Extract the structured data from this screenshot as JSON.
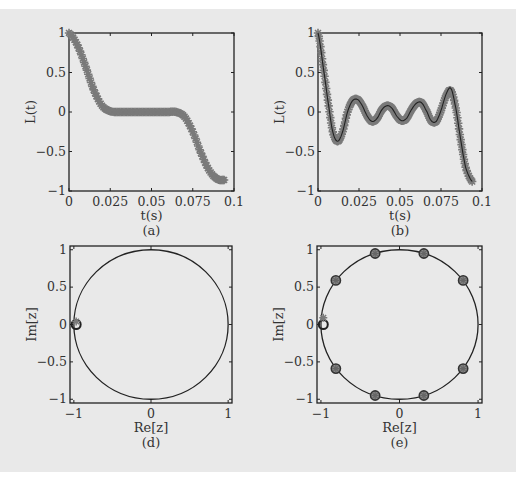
{
  "chart_data": [
    {
      "id": "a",
      "type": "line",
      "panel_label": "(a)",
      "xlabel": "t(s)",
      "ylabel": "L(t)",
      "xlim": [
        0,
        0.1
      ],
      "ylim": [
        -1,
        1
      ],
      "xticks": [
        0,
        0.025,
        0.05,
        0.075,
        0.1
      ],
      "xtick_labels": [
        "0",
        "0.025",
        "0.05",
        "0.075",
        "0.1"
      ],
      "yticks": [
        -1,
        -0.5,
        0,
        0.5,
        1
      ],
      "ytick_labels": [
        "−1",
        "−0.5",
        "0",
        "0.5",
        "1"
      ],
      "series": [
        {
          "name": "L(t) samples",
          "marker": "star",
          "color": "#7a7a7a",
          "x": [
            0,
            0.005,
            0.01,
            0.015,
            0.02,
            0.025,
            0.03,
            0.035,
            0.04,
            0.045,
            0.05,
            0.055,
            0.06,
            0.065,
            0.07,
            0.075,
            0.08,
            0.085,
            0.09,
            0.094
          ],
          "y": [
            1.0,
            0.85,
            0.58,
            0.28,
            0.08,
            0.01,
            0.0,
            0.0,
            0.0,
            0.0,
            0.0,
            0.0,
            0.0,
            0.0,
            -0.06,
            -0.25,
            -0.52,
            -0.74,
            -0.85,
            -0.86
          ]
        }
      ]
    },
    {
      "id": "b",
      "type": "line",
      "panel_label": "(b)",
      "xlabel": "t(s)",
      "ylabel": "L(t)",
      "xlim": [
        0,
        0.1
      ],
      "ylim": [
        -1,
        1
      ],
      "xticks": [
        0,
        0.025,
        0.05,
        0.075,
        0.1
      ],
      "xtick_labels": [
        "0",
        "0.025",
        "0.05",
        "0.075",
        "0.1"
      ],
      "yticks": [
        -1,
        -0.5,
        0,
        0.5,
        1
      ],
      "ytick_labels": [
        "−1",
        "−0.5",
        "0",
        "0.5",
        "1"
      ],
      "series": [
        {
          "name": "L(t) samples",
          "marker": "star",
          "color": "#7a7a7a",
          "x": [
            0,
            0.003,
            0.006,
            0.009,
            0.012,
            0.015,
            0.018,
            0.021,
            0.024,
            0.027,
            0.03,
            0.033,
            0.036,
            0.039,
            0.042,
            0.045,
            0.048,
            0.051,
            0.054,
            0.057,
            0.06,
            0.063,
            0.066,
            0.069,
            0.072,
            0.075,
            0.078,
            0.081,
            0.084,
            0.087,
            0.09,
            0.094
          ],
          "y": [
            1.0,
            0.6,
            0.15,
            -0.25,
            -0.37,
            -0.25,
            0.0,
            0.14,
            0.16,
            0.08,
            -0.05,
            -0.12,
            -0.08,
            0.03,
            0.08,
            0.05,
            -0.05,
            -0.11,
            -0.08,
            0.03,
            0.11,
            0.12,
            0.02,
            -0.11,
            -0.12,
            0.02,
            0.2,
            0.27,
            0.05,
            -0.35,
            -0.7,
            -0.88
          ]
        },
        {
          "name": "L(t) reference",
          "marker": "none",
          "color": "#222222",
          "x": [
            0,
            0.003,
            0.006,
            0.009,
            0.012,
            0.015,
            0.018,
            0.021,
            0.024,
            0.027,
            0.03,
            0.033,
            0.036,
            0.039,
            0.042,
            0.045,
            0.048,
            0.051,
            0.054,
            0.057,
            0.06,
            0.063,
            0.066,
            0.069,
            0.072,
            0.075,
            0.078,
            0.081,
            0.084,
            0.087,
            0.09,
            0.094
          ],
          "y": [
            1.0,
            0.6,
            0.15,
            -0.25,
            -0.37,
            -0.25,
            0.0,
            0.14,
            0.16,
            0.08,
            -0.05,
            -0.12,
            -0.08,
            0.03,
            0.08,
            0.05,
            -0.05,
            -0.11,
            -0.08,
            0.03,
            0.11,
            0.12,
            0.02,
            -0.11,
            -0.12,
            0.02,
            0.22,
            0.3,
            0.05,
            -0.35,
            -0.7,
            -0.88
          ]
        }
      ]
    },
    {
      "id": "d",
      "type": "scatter",
      "panel_label": "(d)",
      "xlabel": "Re[z]",
      "ylabel": "Im[z]",
      "xlim": [
        -1.05,
        1.05
      ],
      "ylim": [
        -1.05,
        1.05
      ],
      "xticks": [
        -1,
        0,
        1
      ],
      "xtick_labels": [
        "−1",
        "0",
        "1"
      ],
      "yticks": [
        -1,
        -0.5,
        0,
        0.5,
        1
      ],
      "ytick_labels": [
        "−1",
        "−0.5",
        "0",
        "0.5",
        "1"
      ],
      "unit_circle": true,
      "circle_color": "#222222",
      "points": [
        {
          "re": -0.97,
          "im": 0.0,
          "marker": "circle",
          "color": "#222222"
        },
        {
          "re": -0.97,
          "im": 0.04,
          "marker": "star",
          "color": "#7a7a7a"
        }
      ]
    },
    {
      "id": "e",
      "type": "scatter",
      "panel_label": "(e)",
      "xlabel": "Re[z]",
      "ylabel": "Im[z]",
      "xlim": [
        -1.05,
        1.05
      ],
      "ylim": [
        -1.05,
        1.05
      ],
      "xticks": [
        -1,
        0,
        1
      ],
      "xtick_labels": [
        "−1",
        "0",
        "1"
      ],
      "yticks": [
        -1,
        -0.5,
        0,
        0.5,
        1
      ],
      "ytick_labels": [
        "−1",
        "−0.5",
        "0",
        "0.5",
        "1"
      ],
      "unit_circle": true,
      "circle_color": "#222222",
      "points": [
        {
          "re": -0.97,
          "im": 0.0,
          "marker": "circle",
          "color": "#222222"
        },
        {
          "re": -0.97,
          "im": 0.09,
          "marker": "star",
          "color": "#7a7a7a"
        },
        {
          "re": -0.81,
          "im": 0.59,
          "marker": "circle-star",
          "color": "#555555"
        },
        {
          "re": -0.31,
          "im": 0.95,
          "marker": "circle-star",
          "color": "#555555"
        },
        {
          "re": 0.31,
          "im": 0.95,
          "marker": "circle-star",
          "color": "#555555"
        },
        {
          "re": 0.81,
          "im": 0.59,
          "marker": "circle-star",
          "color": "#555555"
        },
        {
          "re": 0.81,
          "im": -0.59,
          "marker": "circle-star",
          "color": "#555555"
        },
        {
          "re": 0.31,
          "im": -0.95,
          "marker": "circle-star",
          "color": "#555555"
        },
        {
          "re": -0.31,
          "im": -0.95,
          "marker": "circle-star",
          "color": "#555555"
        },
        {
          "re": -0.81,
          "im": -0.59,
          "marker": "circle-star",
          "color": "#555555"
        }
      ]
    }
  ]
}
